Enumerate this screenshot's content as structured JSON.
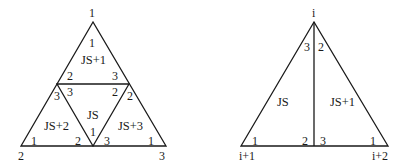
{
  "left_diagram": {
    "outer_vertices": {
      "top": "1",
      "bottom_left": "2",
      "bottom_right": "3"
    },
    "elements": [
      {
        "name": "JS+1",
        "corners": {
          "top": "1",
          "left": "2",
          "right": "3"
        }
      },
      {
        "name": "JS",
        "corners": {
          "left": "3",
          "right": "2",
          "bottom": "1"
        }
      },
      {
        "name": "JS+2",
        "corners": {
          "top": "3",
          "left": "1",
          "right": "2"
        }
      },
      {
        "name": "JS+3",
        "corners": {
          "top": "2",
          "left": "3",
          "right": "1"
        }
      }
    ]
  },
  "right_diagram": {
    "outer_vertices": {
      "top": "i",
      "bottom_left": "i+1",
      "bottom_right": "i+2"
    },
    "elements": [
      {
        "name": "JS",
        "corners": {
          "top": "3",
          "left": "1",
          "right": "2"
        }
      },
      {
        "name": "JS+1",
        "corners": {
          "top": "2",
          "left": "3",
          "right": "1"
        }
      }
    ]
  }
}
